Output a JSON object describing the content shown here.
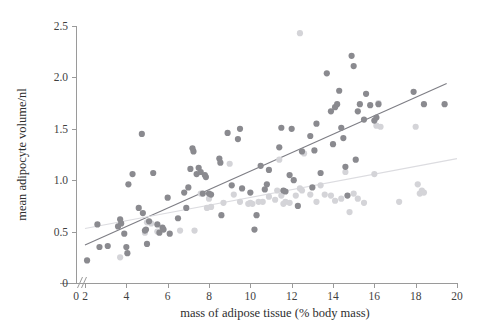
{
  "chart_data": {
    "type": "scatter",
    "title": "",
    "xlabel": "mass of adipose tissue (% body mass)",
    "ylabel": "mean adipocyte volume/nl",
    "xlim": [
      1.2,
      20.4
    ],
    "ylim": [
      0,
      2.5
    ],
    "xticks": [
      0,
      2,
      4,
      6,
      8,
      10,
      12,
      14,
      16,
      18,
      20
    ],
    "xtick_labels": [
      "0",
      "2",
      "4",
      "6",
      "8",
      "10",
      "12",
      "14",
      "16",
      "18",
      "20"
    ],
    "yticks": [
      0,
      0.5,
      1.0,
      1.5,
      2.0,
      2.5
    ],
    "ytick_labels": [
      "0",
      "0.5",
      "1.0",
      "1.5",
      "2.0",
      "2.5"
    ],
    "grid": false,
    "legend": "none",
    "axis_break": {
      "axis": "x",
      "between": [
        0,
        2
      ],
      "glyph": "//"
    },
    "series": [
      {
        "name": "dark-series",
        "color": "#8a8a8f",
        "marker": "circle",
        "marker_size": 5,
        "points": [
          [
            2.1,
            0.22
          ],
          [
            2.6,
            0.57
          ],
          [
            2.7,
            0.35
          ],
          [
            3.1,
            0.36
          ],
          [
            3.6,
            0.55
          ],
          [
            3.7,
            0.62
          ],
          [
            3.75,
            0.58
          ],
          [
            3.9,
            0.48
          ],
          [
            4.0,
            0.35
          ],
          [
            4.05,
            0.29
          ],
          [
            4.1,
            0.96
          ],
          [
            4.3,
            1.06
          ],
          [
            4.6,
            0.73
          ],
          [
            4.75,
            1.45
          ],
          [
            4.8,
            0.68
          ],
          [
            4.9,
            0.51
          ],
          [
            4.95,
            0.52
          ],
          [
            5.0,
            0.38
          ],
          [
            5.1,
            0.6
          ],
          [
            5.3,
            1.07
          ],
          [
            5.5,
            0.57
          ],
          [
            5.6,
            0.49
          ],
          [
            5.75,
            0.54
          ],
          [
            5.8,
            0.52
          ],
          [
            6.0,
            0.83
          ],
          [
            6.1,
            0.48
          ],
          [
            6.5,
            0.63
          ],
          [
            6.8,
            0.88
          ],
          [
            6.9,
            0.73
          ],
          [
            7.0,
            0.93
          ],
          [
            7.1,
            1.11
          ],
          [
            7.2,
            1.31
          ],
          [
            7.25,
            1.28
          ],
          [
            7.4,
            1.06
          ],
          [
            7.5,
            1.12
          ],
          [
            7.6,
            1.08
          ],
          [
            7.7,
            0.87
          ],
          [
            7.8,
            1.05
          ],
          [
            7.85,
            1.03
          ],
          [
            8.0,
            0.87
          ],
          [
            8.1,
            0.86
          ],
          [
            8.5,
            1.21
          ],
          [
            8.55,
            1.17
          ],
          [
            8.6,
            0.66
          ],
          [
            8.9,
            1.46
          ],
          [
            9.1,
            0.95
          ],
          [
            9.4,
            1.4
          ],
          [
            9.5,
            1.5
          ],
          [
            9.6,
            0.92
          ],
          [
            10.0,
            0.88
          ],
          [
            10.2,
            0.52
          ],
          [
            10.3,
            0.66
          ],
          [
            10.5,
            1.14
          ],
          [
            10.7,
            0.91
          ],
          [
            10.8,
            0.96
          ],
          [
            10.9,
            1.1
          ],
          [
            11.4,
            1.32
          ],
          [
            11.5,
            1.51
          ],
          [
            11.6,
            0.9
          ],
          [
            11.7,
            0.89
          ],
          [
            11.9,
            1.05
          ],
          [
            12.0,
            1.5
          ],
          [
            12.1,
            1.0
          ],
          [
            12.3,
            0.75
          ],
          [
            12.5,
            1.28
          ],
          [
            12.9,
            1.43
          ],
          [
            13.0,
            0.93
          ],
          [
            13.1,
            1.29
          ],
          [
            13.2,
            1.55
          ],
          [
            13.4,
            1.07
          ],
          [
            13.7,
            2.04
          ],
          [
            13.9,
            1.67
          ],
          [
            14.0,
            1.35
          ],
          [
            14.1,
            1.71
          ],
          [
            14.2,
            1.74
          ],
          [
            14.3,
            1.87
          ],
          [
            14.4,
            1.51
          ],
          [
            14.5,
            1.41
          ],
          [
            14.6,
            1.13
          ],
          [
            14.7,
            0.85
          ],
          [
            14.9,
            2.21
          ],
          [
            15.0,
            2.11
          ],
          [
            15.1,
            1.2
          ],
          [
            15.2,
            1.67
          ],
          [
            15.3,
            1.74
          ],
          [
            15.5,
            1.59
          ],
          [
            15.6,
            1.84
          ],
          [
            15.8,
            1.73
          ],
          [
            16.0,
            1.58
          ],
          [
            16.1,
            1.61
          ],
          [
            16.2,
            1.74
          ],
          [
            17.9,
            1.86
          ],
          [
            18.4,
            1.74
          ],
          [
            19.4,
            1.74
          ]
        ]
      },
      {
        "name": "light-series",
        "color": "#d4d4d8",
        "marker": "circle",
        "marker_size": 5,
        "points": [
          [
            3.7,
            0.25
          ],
          [
            4.9,
            0.49
          ],
          [
            5.0,
            0.59
          ],
          [
            5.2,
            0.58
          ],
          [
            5.5,
            0.5
          ],
          [
            6.6,
            0.51
          ],
          [
            7.3,
            0.51
          ],
          [
            7.6,
            0.87
          ],
          [
            7.9,
            0.73
          ],
          [
            8.0,
            0.82
          ],
          [
            8.1,
            0.74
          ],
          [
            8.7,
            0.78
          ],
          [
            9.0,
            1.16
          ],
          [
            9.2,
            0.86
          ],
          [
            9.5,
            0.79
          ],
          [
            9.9,
            0.77
          ],
          [
            10.0,
            0.78
          ],
          [
            10.1,
            0.77
          ],
          [
            10.4,
            0.79
          ],
          [
            10.6,
            0.79
          ],
          [
            10.9,
            0.84
          ],
          [
            11.2,
            0.81
          ],
          [
            11.3,
            0.9
          ],
          [
            11.4,
            1.2
          ],
          [
            11.5,
            0.85
          ],
          [
            11.6,
            0.77
          ],
          [
            11.7,
            0.79
          ],
          [
            11.9,
            0.78
          ],
          [
            12.2,
            0.85
          ],
          [
            12.4,
            0.92
          ],
          [
            12.5,
            0.9
          ],
          [
            12.6,
            1.26
          ],
          [
            12.9,
            0.86
          ],
          [
            13.2,
            0.79
          ],
          [
            13.4,
            0.95
          ],
          [
            13.6,
            0.86
          ],
          [
            13.9,
            0.85
          ],
          [
            14.1,
            0.8
          ],
          [
            14.4,
            0.82
          ],
          [
            14.6,
            1.08
          ],
          [
            14.8,
            0.69
          ],
          [
            15.0,
            0.87
          ],
          [
            15.2,
            0.82
          ],
          [
            15.5,
            0.78
          ],
          [
            16.0,
            1.06
          ],
          [
            16.1,
            1.53
          ],
          [
            16.2,
            1.75
          ],
          [
            16.3,
            1.52
          ],
          [
            17.2,
            0.79
          ],
          [
            18.0,
            1.52
          ],
          [
            18.1,
            0.96
          ],
          [
            18.2,
            0.87
          ],
          [
            18.3,
            0.9
          ],
          [
            18.4,
            0.88
          ],
          [
            12.4,
            2.43
          ]
        ]
      }
    ],
    "trend_lines": [
      {
        "name": "dark-trend",
        "for_series": "dark-series",
        "color": "#7d7d84",
        "from": [
          2.0,
          0.37
        ],
        "to": [
          19.5,
          1.94
        ],
        "slope": 0.0897,
        "intercept": 0.1906
      },
      {
        "name": "light-trend",
        "for_series": "light-series",
        "color": "#dcdce0",
        "from": [
          2.0,
          0.53
        ],
        "to": [
          20.0,
          1.21
        ],
        "slope": 0.0378,
        "intercept": 0.4544
      }
    ]
  }
}
